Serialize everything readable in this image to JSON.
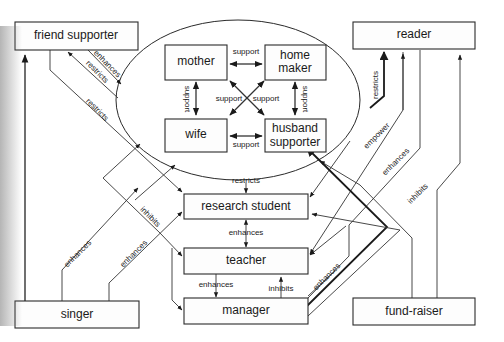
{
  "nodes": {
    "friend_supporter": "friend supporter",
    "reader": "reader",
    "mother": "mother",
    "home_maker_1": "home",
    "home_maker_2": "maker",
    "wife": "wife",
    "husband_supporter_1": "husband",
    "husband_supporter_2": "supporter",
    "research_student": "research student",
    "teacher": "teacher",
    "singer": "singer",
    "manager": "manager",
    "fund_raiser": "fund-raiser"
  },
  "edges": {
    "mother_homemaker": "support",
    "mother_wife": "support",
    "homemaker_husband": "support",
    "wife_husband": "support",
    "diag_left": "support",
    "diag_right": "support",
    "friend_enhances": "enhances",
    "friend_restricts_ellipse": "restricts",
    "friend_restricts_student": "restricts",
    "ellipse_restricts_student": "restricts",
    "student_teacher": "enhances",
    "teacher_manager": "enhances",
    "manager_teacher": "inhibits",
    "singer_enhances_1": "enhances",
    "singer_enhances_2": "enhances",
    "singer_inhibits": "inhibits",
    "restricts_reader": "restricts",
    "empower": "empower",
    "reader_enhances": "enhances",
    "fundraiser_inhibits": "inhibits",
    "manager_enhances": "enhances"
  }
}
